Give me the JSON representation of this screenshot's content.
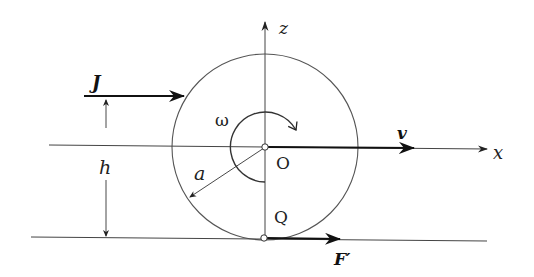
{
  "diagram": {
    "type": "rolling-disk-impulse",
    "labels": {
      "z_axis": "z",
      "x_axis": "x",
      "impulse": "J",
      "angular_velocity": "ω",
      "velocity": "v",
      "center": "O",
      "contact_point": "Q",
      "radius": "a",
      "height": "h",
      "friction_force": "F′"
    },
    "colors": {
      "line": "#333333",
      "thick_arrow": "#111111",
      "background": "#ffffff"
    }
  }
}
